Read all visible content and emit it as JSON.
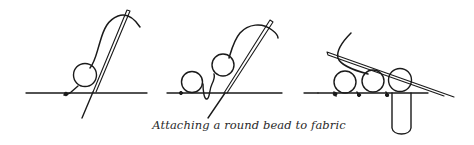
{
  "figure": {
    "caption": "Attaching a round bead to fabric",
    "stroke_color": "#1a1a1a",
    "background": "#ffffff",
    "panels": [
      {
        "id": "step-1",
        "beads": 1,
        "description": "needle passes up through fabric and bead"
      },
      {
        "id": "step-2",
        "beads": 2,
        "description": "first bead stitched, second bead picked up"
      },
      {
        "id": "step-3",
        "beads": 3,
        "description": "row of beads with needle passing back through"
      }
    ]
  }
}
